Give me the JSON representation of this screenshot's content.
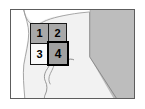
{
  "figure": {
    "name": "california-index-locator-map",
    "frame_border_color": "#5d5d5d",
    "land_color": "#f2f2f2",
    "neighbor_state_color": "#bdbdbd",
    "water_color": "#ffffff",
    "shaded_cell_color": "#a8a8a8",
    "unshaded_cell_color": "#fafafa",
    "highlight_border_color": "#000000"
  },
  "grid": {
    "name": "quadrangle-index-grid",
    "rows": 2,
    "columns": 2,
    "cells": [
      {
        "label": "1",
        "shaded": true,
        "highlighted": false
      },
      {
        "label": "2",
        "shaded": true,
        "highlighted": false
      },
      {
        "label": "3",
        "shaded": false,
        "highlighted": false
      },
      {
        "label": "4",
        "shaded": true,
        "highlighted": true
      }
    ]
  },
  "regions": [
    {
      "name": "california-outline",
      "fill": "#f2f2f2"
    },
    {
      "name": "nevada-area",
      "fill": "#bdbdbd"
    },
    {
      "name": "pacific-ocean-bay",
      "fill": "#ffffff"
    },
    {
      "name": "river-trace",
      "fill": "none"
    }
  ]
}
